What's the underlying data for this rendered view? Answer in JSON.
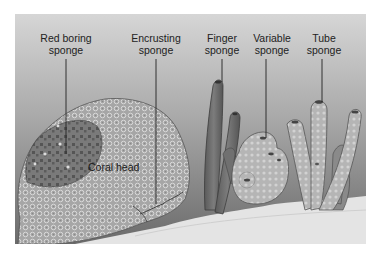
{
  "diagram": {
    "type": "labeled-illustration",
    "labels": [
      {
        "id": "red-boring",
        "line1": "Red boring",
        "line2": "sponge",
        "x": 66,
        "y": 32
      },
      {
        "id": "encrusting",
        "line1": "Encrusting",
        "line2": "sponge",
        "x": 156,
        "y": 32
      },
      {
        "id": "finger",
        "line1": "Finger",
        "line2": "sponge",
        "x": 222,
        "y": 32
      },
      {
        "id": "variable",
        "line1": "Variable",
        "line2": "sponge",
        "x": 272,
        "y": 32
      },
      {
        "id": "tube",
        "line1": "Tube",
        "line2": "sponge",
        "x": 322,
        "y": 32
      }
    ],
    "inline_labels": [
      {
        "id": "coral-head",
        "text": "Coral head",
        "x": 88,
        "y": 162
      }
    ],
    "colors": {
      "water_top": "#d4d4d4",
      "water_bottom": "#6e6e6e",
      "sand": "#e6e6e6",
      "coral": "#a9a9a9",
      "red_boring": "#6a6a6a",
      "finger": "#6c6c6c",
      "variable": "#b4b4b4",
      "tube": "#b8b8b8",
      "leader_line": "#222222"
    }
  }
}
